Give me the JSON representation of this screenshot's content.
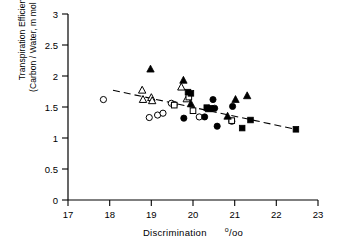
{
  "chart_data": {
    "type": "scatter",
    "title": "",
    "xlabel": "Discrimination",
    "xlabel_units": "o/oo",
    "ylabel_line1": "Transpiration  Efficiency",
    "ylabel_line2": "(Carbon / Water,  m mol / mol)",
    "xlim": [
      17,
      23
    ],
    "ylim": [
      0,
      3
    ],
    "xticks": [
      "17",
      "18",
      "19",
      "20",
      "21",
      "22",
      "23"
    ],
    "yticks": [
      "0",
      "0.5",
      "1",
      "1.5",
      "2",
      "2.5",
      "3"
    ],
    "grid": false,
    "legend": "none",
    "series": [
      {
        "name": "open-circle",
        "marker": "open-circle",
        "points": [
          [
            17.85,
            1.62
          ],
          [
            18.95,
            1.33
          ],
          [
            19.15,
            1.37
          ],
          [
            19.28,
            1.4
          ],
          [
            19.48,
            1.56
          ],
          [
            19.55,
            1.54
          ],
          [
            20.15,
            1.34
          ],
          [
            20.93,
            1.27
          ]
        ]
      },
      {
        "name": "open-triangle",
        "marker": "open-triangle",
        "points": [
          [
            18.78,
            1.77
          ],
          [
            18.8,
            1.62
          ],
          [
            19.0,
            1.65
          ],
          [
            19.02,
            1.6
          ],
          [
            19.72,
            1.82
          ],
          [
            19.85,
            1.63
          ]
        ]
      },
      {
        "name": "open-square",
        "marker": "open-square",
        "points": [
          [
            19.55,
            1.53
          ],
          [
            19.9,
            1.66
          ],
          [
            20.0,
            1.44
          ],
          [
            20.93,
            1.28
          ]
        ]
      },
      {
        "name": "filled-triangle",
        "marker": "filled-triangle",
        "points": [
          [
            18.98,
            2.11
          ],
          [
            19.77,
            1.93
          ],
          [
            19.95,
            1.55
          ],
          [
            20.38,
            1.47
          ],
          [
            20.83,
            1.35
          ],
          [
            21.02,
            1.62
          ],
          [
            21.3,
            1.68
          ]
        ]
      },
      {
        "name": "filled-square",
        "marker": "filled-square",
        "points": [
          [
            19.88,
            1.74
          ],
          [
            19.95,
            1.72
          ],
          [
            20.33,
            1.49
          ],
          [
            20.42,
            1.48
          ],
          [
            21.18,
            1.16
          ],
          [
            21.38,
            1.29
          ],
          [
            22.47,
            1.14
          ]
        ]
      },
      {
        "name": "filled-circle",
        "marker": "filled-circle",
        "points": [
          [
            19.78,
            1.32
          ],
          [
            20.28,
            1.34
          ],
          [
            20.48,
            1.62
          ],
          [
            20.52,
            1.48
          ],
          [
            20.58,
            1.19
          ],
          [
            20.95,
            1.51
          ]
        ]
      }
    ],
    "trend_line": {
      "style": "dashed",
      "x0": 18.08,
      "y0": 1.77,
      "x1": 22.47,
      "y1": 1.14
    }
  }
}
